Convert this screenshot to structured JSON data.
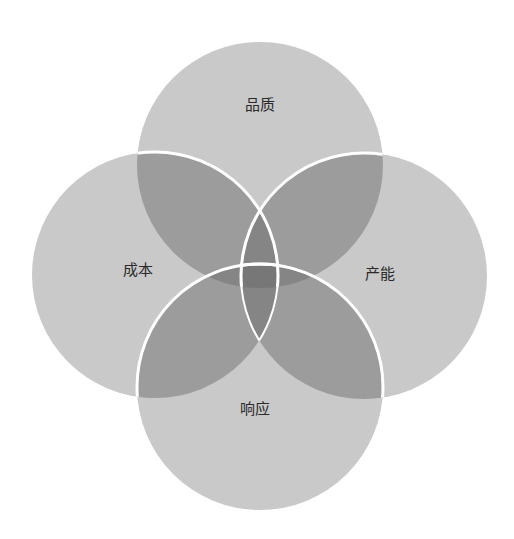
{
  "diagram": {
    "type": "four-circle-venn",
    "colors": {
      "circle_fill": "#c9c9c9",
      "overlap_2": "#9c9c9c",
      "overlap_3": "#7f7f7f",
      "stroke": "#ffffff",
      "text": "#2a2a2a"
    },
    "circles": [
      {
        "id": "top",
        "label": "品质",
        "cx": 260,
        "cy": 165,
        "r": 123
      },
      {
        "id": "left",
        "label": "成本",
        "cx": 155,
        "cy": 275,
        "r": 123
      },
      {
        "id": "right",
        "label": "产能",
        "cx": 364,
        "cy": 276,
        "r": 123
      },
      {
        "id": "bottom",
        "label": "响应",
        "cx": 260,
        "cy": 387,
        "r": 123
      }
    ]
  }
}
